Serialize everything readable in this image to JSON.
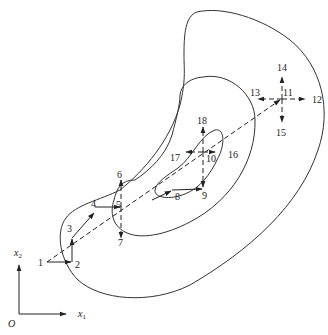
{
  "diagram": {
    "axes": {
      "origin_label": "O",
      "x_label": "x",
      "x_sub": "1",
      "y_label": "x",
      "y_sub": "2"
    },
    "points": [
      {
        "id": "1",
        "label": "1"
      },
      {
        "id": "2",
        "label": "2"
      },
      {
        "id": "3",
        "label": "3"
      },
      {
        "id": "4",
        "label": "4"
      },
      {
        "id": "5",
        "label": "5"
      },
      {
        "id": "6",
        "label": "6"
      },
      {
        "id": "7",
        "label": "7"
      },
      {
        "id": "8",
        "label": "8"
      },
      {
        "id": "9",
        "label": "9"
      },
      {
        "id": "10",
        "label": "10"
      },
      {
        "id": "11",
        "label": "11"
      },
      {
        "id": "12",
        "label": "12"
      },
      {
        "id": "13",
        "label": "13"
      },
      {
        "id": "14",
        "label": "14"
      },
      {
        "id": "15",
        "label": "15"
      },
      {
        "id": "16",
        "label": "16"
      },
      {
        "id": "17",
        "label": "17"
      },
      {
        "id": "18",
        "label": "18"
      }
    ],
    "contours": [
      "outer",
      "middle",
      "inner"
    ]
  }
}
